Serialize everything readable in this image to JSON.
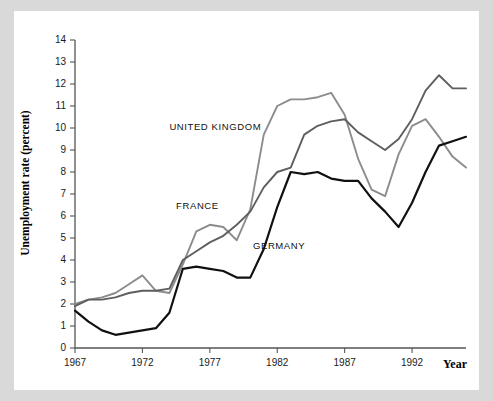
{
  "chart_data": {
    "type": "line",
    "title": "",
    "xlabel": "Year",
    "ylabel": "Unemployment rate (percent)",
    "xlim": [
      1967,
      1996
    ],
    "ylim": [
      0,
      14
    ],
    "xticks": [
      1967,
      1972,
      1977,
      1982,
      1987,
      1992
    ],
    "yticks": [
      0,
      1,
      2,
      3,
      4,
      5,
      6,
      7,
      8,
      9,
      10,
      11,
      12,
      13,
      14
    ],
    "grid": false,
    "legend_position": "inline-annotations",
    "x": [
      1967,
      1968,
      1969,
      1970,
      1971,
      1972,
      1973,
      1974,
      1975,
      1976,
      1977,
      1978,
      1979,
      1980,
      1981,
      1982,
      1983,
      1984,
      1985,
      1986,
      1987,
      1988,
      1989,
      1990,
      1991,
      1992,
      1993,
      1994,
      1995,
      1996
    ],
    "series": [
      {
        "name": "UNITED KINGDOM",
        "color": "#8c8c8c",
        "width": 1.9,
        "label_x": 1974.0,
        "label_y": 9.9,
        "values": [
          2.0,
          2.2,
          2.3,
          2.5,
          2.9,
          3.3,
          2.6,
          2.5,
          3.8,
          5.3,
          5.6,
          5.5,
          4.9,
          6.3,
          9.7,
          11.0,
          11.3,
          11.3,
          11.4,
          11.6,
          10.6,
          8.6,
          7.2,
          6.9,
          8.8,
          10.1,
          10.4,
          9.6,
          8.7,
          8.2
        ],
        "annotations": []
      },
      {
        "name": "FRANCE",
        "color": "#5e5e5e",
        "width": 1.9,
        "label_x": 1974.5,
        "label_y": 6.3,
        "values": [
          1.9,
          2.2,
          2.2,
          2.3,
          2.5,
          2.6,
          2.6,
          2.7,
          4.0,
          4.4,
          4.8,
          5.1,
          5.6,
          6.2,
          7.3,
          8.0,
          8.2,
          9.7,
          10.1,
          10.3,
          10.4,
          9.8,
          9.4,
          9.0,
          9.5,
          10.4,
          11.7,
          12.4,
          11.8,
          11.8
        ],
        "annotations": []
      },
      {
        "name": "GERMANY",
        "color": "#111111",
        "width": 2.2,
        "label_x": 1980.2,
        "label_y": 4.5,
        "values": [
          1.7,
          1.2,
          0.8,
          0.6,
          0.7,
          0.8,
          0.9,
          1.6,
          3.6,
          3.7,
          3.6,
          3.5,
          3.2,
          3.2,
          4.5,
          6.4,
          8.0,
          7.9,
          8.0,
          7.7,
          7.6,
          7.6,
          6.8,
          6.2,
          5.5,
          6.6,
          8.0,
          9.2,
          9.4,
          9.6
        ],
        "annotations": []
      }
    ]
  },
  "figure": {
    "background": "#ffffff",
    "page_background": "#d9d9d9"
  }
}
